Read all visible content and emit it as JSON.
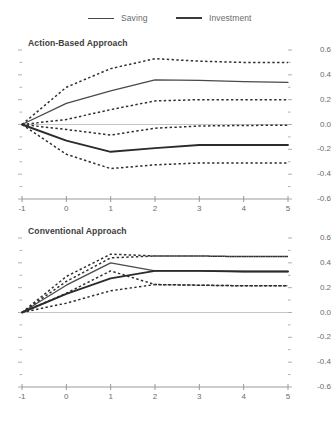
{
  "figure": {
    "clipped_header": "",
    "legend": [
      {
        "label": "Saving",
        "style": "solid-thin",
        "color": "#4a4a4a"
      },
      {
        "label": "Investment",
        "style": "solid-thick",
        "color": "#3a3a3a"
      }
    ]
  },
  "chart_data": [
    {
      "type": "line",
      "title": "Action-Based Approach",
      "xlabel": "",
      "ylabel": "",
      "xlim": [
        -1,
        5
      ],
      "ylim": [
        -0.6,
        0.6
      ],
      "xticks": [
        -1,
        0,
        1,
        2,
        3,
        4,
        5
      ],
      "yticks": [
        0.6,
        0.4,
        0.2,
        0.0,
        -0.2,
        -0.4,
        -0.6
      ],
      "ytick_labels": [
        "0.6",
        "0.4",
        "0.2",
        "0.0",
        "-0.2",
        "-0.4",
        "-0.6"
      ],
      "xtick_labels": [
        "-1",
        "0",
        "1",
        "2",
        "3",
        "4",
        "5"
      ],
      "minor_ytick_step": 0.1,
      "grid": false,
      "zero_line": true,
      "legend_position": "top-shared",
      "x": [
        -1,
        0,
        1,
        2,
        3,
        4,
        5
      ],
      "series": [
        {
          "name": "Saving",
          "style": "solid",
          "values": [
            0.0,
            0.17,
            0.27,
            0.36,
            0.355,
            0.345,
            0.34
          ]
        },
        {
          "name": "Saving upper CI",
          "style": "dashed",
          "values": [
            0.0,
            0.3,
            0.45,
            0.53,
            0.51,
            0.5,
            0.5
          ]
        },
        {
          "name": "Saving lower CI",
          "style": "dashed",
          "values": [
            0.0,
            0.04,
            0.12,
            0.19,
            0.2,
            0.2,
            0.2
          ]
        },
        {
          "name": "Investment",
          "style": "solid",
          "values": [
            0.0,
            -0.13,
            -0.22,
            -0.19,
            -0.165,
            -0.165,
            -0.165
          ]
        },
        {
          "name": "Investment upper CI",
          "style": "dashed",
          "values": [
            0.0,
            -0.04,
            -0.085,
            -0.03,
            -0.012,
            -0.008,
            -0.005
          ]
        },
        {
          "name": "Investment lower CI",
          "style": "dashed",
          "values": [
            0.0,
            -0.24,
            -0.355,
            -0.325,
            -0.31,
            -0.31,
            -0.31
          ]
        }
      ]
    },
    {
      "type": "line",
      "title": "Conventional Approach",
      "xlabel": "",
      "ylabel": "",
      "xlim": [
        -1,
        5
      ],
      "ylim": [
        -0.6,
        0.6
      ],
      "xticks": [
        -1,
        0,
        1,
        2,
        3,
        4,
        5
      ],
      "yticks": [
        0.6,
        0.4,
        0.2,
        0.0,
        -0.2,
        -0.4,
        -0.6
      ],
      "ytick_labels": [
        "0.6",
        "0.4",
        "0.2",
        "0.0",
        "-0.2",
        "-0.4",
        "-0.6"
      ],
      "xtick_labels": [
        "-1",
        "0",
        "1",
        "2",
        "3",
        "4",
        "5"
      ],
      "minor_ytick_step": 0.1,
      "grid": false,
      "zero_line": true,
      "legend_position": "top-shared",
      "x": [
        -1,
        0,
        1,
        2,
        3,
        4,
        5
      ],
      "series": [
        {
          "name": "Saving",
          "style": "solid",
          "values": [
            0.0,
            0.22,
            0.4,
            0.335,
            0.335,
            0.33,
            0.33
          ]
        },
        {
          "name": "Saving upper CI",
          "style": "dashed",
          "values": [
            0.0,
            0.29,
            0.47,
            0.455,
            0.455,
            0.45,
            0.45
          ]
        },
        {
          "name": "Saving lower CI",
          "style": "dashed",
          "values": [
            0.0,
            0.155,
            0.335,
            0.225,
            0.22,
            0.215,
            0.215
          ]
        },
        {
          "name": "Investment",
          "style": "solid",
          "values": [
            0.0,
            0.15,
            0.275,
            0.335,
            0.335,
            0.33,
            0.33
          ]
        },
        {
          "name": "Investment upper CI",
          "style": "dashed",
          "values": [
            0.0,
            0.25,
            0.44,
            0.455,
            0.455,
            0.45,
            0.45
          ]
        },
        {
          "name": "Investment lower CI",
          "style": "dashed",
          "values": [
            0.0,
            0.075,
            0.175,
            0.225,
            0.22,
            0.215,
            0.215
          ]
        }
      ]
    }
  ]
}
